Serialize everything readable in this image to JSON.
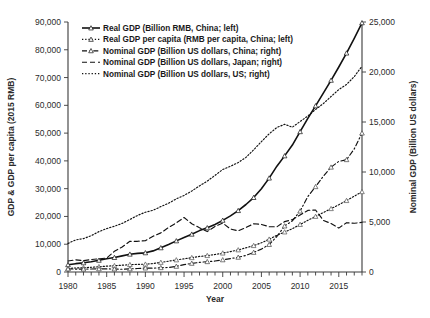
{
  "chart_data": {
    "type": "line",
    "title": "",
    "xlabel": "Year",
    "ylabel": "GDP & GDP per capita (2015 RMB)",
    "ylabel_right": "Nominal GDP (Billion US dollars)",
    "xlim": [
      1980,
      2018
    ],
    "ylim": [
      0,
      90000
    ],
    "ylim_right": [
      0,
      25000
    ],
    "grid": false,
    "legend_position": "top-left",
    "x_ticks_major": [
      1980,
      1985,
      1990,
      1995,
      2000,
      2005,
      2010,
      2015
    ],
    "x_tick_labels": [
      "1980",
      "1985",
      "1990",
      "1995",
      "2000",
      "2005",
      "2010",
      "2015"
    ],
    "y_ticks_left": [
      0,
      10000,
      20000,
      30000,
      40000,
      50000,
      60000,
      70000,
      80000,
      90000
    ],
    "y_tick_labels_left": [
      "0",
      "10,000",
      "20,000",
      "30,000",
      "40,000",
      "50,000",
      "60,000",
      "70,000",
      "80,000",
      "90,000"
    ],
    "y_ticks_right": [
      0,
      5000,
      10000,
      15000,
      20000,
      25000
    ],
    "y_tick_labels_right": [
      "0",
      "5,000",
      "10,000",
      "15,000",
      "20,000",
      "25,000"
    ],
    "x": [
      1980,
      1981,
      1982,
      1983,
      1984,
      1985,
      1986,
      1987,
      1988,
      1989,
      1990,
      1991,
      1992,
      1993,
      1994,
      1995,
      1996,
      1997,
      1998,
      1999,
      2000,
      2001,
      2002,
      2003,
      2004,
      2005,
      2006,
      2007,
      2008,
      2009,
      2010,
      2011,
      2012,
      2013,
      2014,
      2015,
      2016,
      2017,
      2018
    ],
    "series": [
      {
        "name": "Real GDP (Billion RMB, China; left)",
        "axis": "left",
        "style": "solid",
        "marker": "triangle",
        "color": "#111111",
        "values": [
          2600,
          3000,
          3300,
          3700,
          4200,
          4800,
          5200,
          5800,
          6400,
          6700,
          6900,
          7600,
          8700,
          9900,
          11200,
          12400,
          13600,
          14900,
          15900,
          17100,
          18600,
          20200,
          22100,
          24300,
          26800,
          30000,
          33800,
          38100,
          41800,
          45700,
          50500,
          55300,
          59800,
          64400,
          69000,
          73800,
          78800,
          84100,
          89700
        ]
      },
      {
        "name": "Real GDP per capita (RMB per capita, China; left)",
        "axis": "left",
        "style": "dotted",
        "marker": "triangle",
        "color": "#555555",
        "values": [
          1300,
          1450,
          1550,
          1700,
          1900,
          2100,
          2250,
          2450,
          2650,
          2750,
          2800,
          3050,
          3450,
          3900,
          4350,
          4750,
          5150,
          5600,
          5900,
          6300,
          6800,
          7350,
          7950,
          8700,
          9500,
          10500,
          11800,
          13200,
          14400,
          15600,
          17100,
          18600,
          20000,
          21400,
          22800,
          24200,
          25700,
          27300,
          28900
        ]
      },
      {
        "name": "Nominal GDP (Billion US dollars, China; right)",
        "axis": "right",
        "style": "dashdot",
        "marker": "triangle",
        "color": "#444444",
        "values": [
          305,
          290,
          285,
          305,
          315,
          310,
          300,
          275,
          310,
          350,
          395,
          385,
          430,
          450,
          565,
          740,
          865,
          965,
          1030,
          1095,
          1215,
          1340,
          1470,
          1660,
          1960,
          2290,
          2750,
          3550,
          4600,
          5110,
          6090,
          7550,
          8530,
          9570,
          10480,
          11060,
          11230,
          12310,
          13890
        ]
      },
      {
        "name": "Nominal GDP (Billion US dollars, Japan; right)",
        "axis": "right",
        "style": "dashed",
        "marker": "none",
        "color": "#222222",
        "values": [
          1100,
          1220,
          1130,
          1250,
          1320,
          1400,
          2070,
          2500,
          3070,
          3070,
          3130,
          3580,
          3910,
          4450,
          4910,
          5450,
          4830,
          4420,
          4040,
          4560,
          4890,
          4300,
          4120,
          4450,
          4820,
          4760,
          4530,
          4520,
          5040,
          5230,
          5700,
          6160,
          6200,
          5160,
          4850,
          4390,
          4930,
          4870,
          4970
        ]
      },
      {
        "name": "Nominal GDP (Billion US dollars, US; right)",
        "axis": "right",
        "style": "dotted",
        "marker": "none",
        "color": "#333333",
        "values": [
          2860,
          3210,
          3340,
          3630,
          4040,
          4340,
          4580,
          4860,
          5250,
          5660,
          5980,
          6170,
          6540,
          6880,
          7310,
          7660,
          8100,
          8610,
          9090,
          9660,
          10250,
          10580,
          10940,
          11460,
          12220,
          13040,
          13820,
          14450,
          14770,
          14480,
          15050,
          15600,
          16250,
          16840,
          17550,
          18240,
          18750,
          19540,
          20580
        ]
      }
    ]
  },
  "axes": {
    "left_label": "GDP & GDP per capita (2015 RMB)",
    "right_label": "Nominal GDP (Billion US dollars)",
    "x_label": "Year"
  },
  "legend": {
    "items": [
      {
        "label": "Real GDP (Billion RMB, China; left)",
        "style": "solid",
        "marker": "triangle"
      },
      {
        "label": "Real GDP per capita (RMB per capita, China; left)",
        "style": "dotted",
        "marker": "triangle"
      },
      {
        "label": "Nominal GDP (Billion US dollars, China; right)",
        "style": "dashdot",
        "marker": "triangle"
      },
      {
        "label": "Nominal GDP (Billion US dollars, Japan; right)",
        "style": "dashed",
        "marker": "none"
      },
      {
        "label": "Nominal GDP (Billion US dollars, US; right)",
        "style": "dotted",
        "marker": "none"
      }
    ]
  }
}
